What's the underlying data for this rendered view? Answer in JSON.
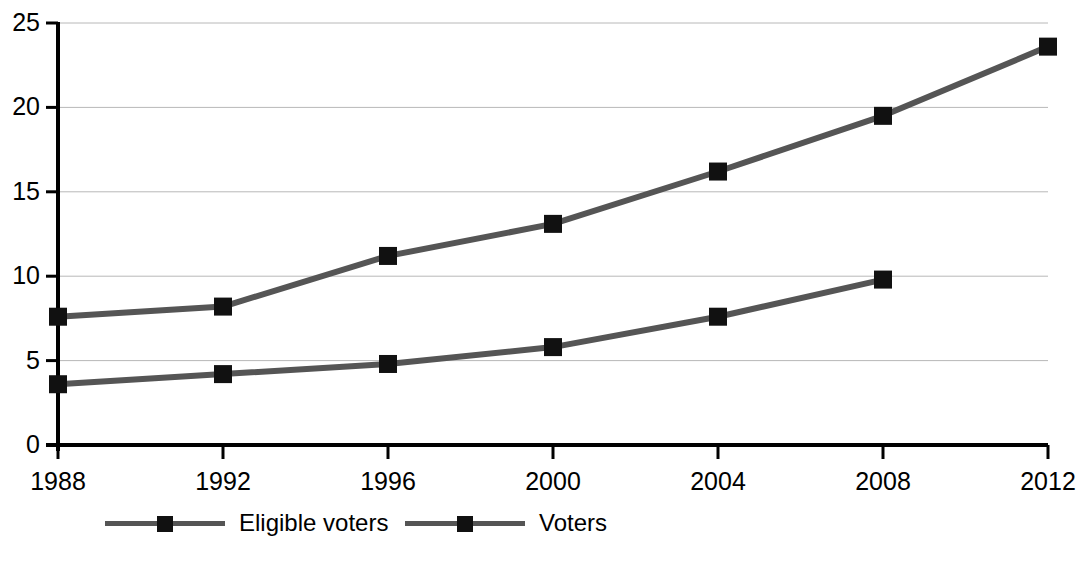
{
  "chart_data": {
    "type": "line",
    "title": "",
    "xlabel": "",
    "ylabel": "",
    "categories": [
      "1988",
      "1992",
      "1996",
      "2000",
      "2004",
      "2008",
      "2012"
    ],
    "x": [
      1988,
      1992,
      1996,
      2000,
      2004,
      2008,
      2012
    ],
    "series": [
      {
        "name": "Eligible voters",
        "color": "#555555",
        "marker": "square",
        "marker_color": "#111111",
        "values": [
          7.6,
          8.2,
          11.2,
          13.1,
          16.2,
          19.5,
          23.6
        ]
      },
      {
        "name": "Voters",
        "color": "#555555",
        "marker": "square",
        "marker_color": "#111111",
        "values": [
          3.6,
          4.2,
          4.8,
          5.8,
          7.6,
          9.8,
          null
        ]
      }
    ],
    "ylim": [
      0,
      25
    ],
    "yticks": [
      0,
      5,
      10,
      15,
      20,
      25
    ],
    "ytick_labels": [
      "0",
      "5",
      "10",
      "15",
      "20",
      "25"
    ],
    "xlim": [
      1988,
      2012
    ],
    "xticks": [
      1988,
      1992,
      1996,
      2000,
      2004,
      2008,
      2012
    ],
    "grid": "horizontal",
    "grid_color": "#b8b8b8",
    "axis_color": "#000000",
    "legend_position": "bottom-left",
    "legend": [
      "Eligible voters",
      "Voters"
    ]
  },
  "legend": {
    "items": [
      {
        "label": "Eligible voters"
      },
      {
        "label": "Voters"
      }
    ]
  }
}
